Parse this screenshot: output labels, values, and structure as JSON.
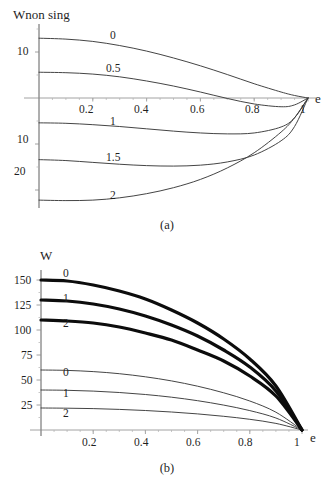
{
  "figure": {
    "panels": [
      {
        "id": "a",
        "caption": "(a)",
        "y_axis_title": "Wnon sing",
        "x_axis_title": "e",
        "y_ticks": [
          "10",
          "10",
          "20"
        ],
        "x_ticks": [
          "0.2",
          "0.4",
          "0.6",
          "0.8",
          "1"
        ],
        "curve_labels": [
          "0",
          "0.5",
          "1",
          "1.5",
          "2"
        ]
      },
      {
        "id": "b",
        "caption": "(b)",
        "y_axis_title": "W",
        "x_axis_title": "e",
        "y_ticks": [
          "150",
          "125",
          "100",
          "75",
          "50",
          "25"
        ],
        "x_ticks": [
          "0.2",
          "0.4",
          "0.6",
          "0.8",
          "1"
        ],
        "curve_labels_thick": [
          "0",
          "1",
          "2"
        ],
        "curve_labels_thin": [
          "0",
          "1",
          "2"
        ]
      }
    ]
  },
  "chart_data": [
    {
      "type": "line",
      "panel": "a",
      "title": "",
      "xlabel": "e",
      "ylabel": "Wnon sing",
      "xlim": [
        0,
        1.0
      ],
      "ylim": [
        -26,
        15
      ],
      "xticks": [
        0.2,
        0.4,
        0.6,
        0.8,
        1.0
      ],
      "yticks": [
        10,
        -10,
        -20
      ],
      "ytick_labels": [
        "10",
        "10",
        "20"
      ],
      "grid": false,
      "legend": "inline-curve-labels",
      "x": [
        0,
        0.1,
        0.2,
        0.3,
        0.4,
        0.5,
        0.6,
        0.7,
        0.8,
        0.9,
        0.95,
        1.0
      ],
      "series": [
        {
          "name": "0",
          "label": "0",
          "style": "thin",
          "values": [
            13.0,
            12.8,
            12.3,
            11.4,
            10.2,
            8.7,
            7.0,
            5.1,
            3.1,
            1.3,
            0.55,
            0.0
          ]
        },
        {
          "name": "0.5",
          "label": "0.5",
          "style": "thin",
          "values": [
            5.6,
            5.5,
            5.2,
            4.6,
            3.7,
            2.6,
            1.3,
            -0.1,
            -1.3,
            -1.9,
            -1.5,
            0.0
          ]
        },
        {
          "name": "1",
          "label": "1",
          "style": "thin",
          "values": [
            -5.4,
            -5.5,
            -5.8,
            -6.2,
            -6.7,
            -7.2,
            -7.6,
            -7.8,
            -7.6,
            -6.3,
            -4.3,
            0.0
          ]
        },
        {
          "name": "1.5",
          "label": "1.5",
          "style": "thin",
          "values": [
            -13.4,
            -13.6,
            -14.0,
            -14.4,
            -14.7,
            -14.8,
            -14.6,
            -13.9,
            -12.4,
            -9.3,
            -6.2,
            0.0
          ]
        },
        {
          "name": "2",
          "label": "2",
          "style": "thin",
          "values": [
            -22.2,
            -22.3,
            -22.2,
            -21.7,
            -20.8,
            -19.5,
            -17.7,
            -15.2,
            -11.9,
            -7.4,
            -4.3,
            0.0
          ]
        }
      ]
    },
    {
      "type": "line",
      "panel": "b",
      "title": "",
      "xlabel": "e",
      "ylabel": "W",
      "xlim": [
        0,
        1.0
      ],
      "ylim": [
        0,
        160
      ],
      "xticks": [
        0.2,
        0.4,
        0.6,
        0.8,
        1.0
      ],
      "yticks": [
        25,
        50,
        75,
        100,
        125,
        150
      ],
      "grid": false,
      "legend": "inline-curve-labels",
      "x": [
        0,
        0.1,
        0.2,
        0.3,
        0.4,
        0.5,
        0.6,
        0.7,
        0.8,
        0.9,
        1.0
      ],
      "series": [
        {
          "name": "thick-0",
          "label": "0",
          "style": "thick",
          "values": [
            150,
            149,
            145,
            139,
            131,
            120,
            107,
            91,
            71,
            44,
            0
          ]
        },
        {
          "name": "thick-1",
          "label": "1",
          "style": "thick",
          "values": [
            130,
            129,
            126,
            121,
            114,
            105,
            94,
            80,
            63,
            39,
            0
          ]
        },
        {
          "name": "thick-2",
          "label": "2",
          "style": "thick",
          "values": [
            110,
            109,
            107,
            103,
            97,
            90,
            80,
            69,
            54,
            34,
            0
          ]
        },
        {
          "name": "thin-0",
          "label": "0",
          "style": "thin",
          "values": [
            60,
            59.6,
            58.4,
            56.3,
            53.2,
            49.1,
            43.8,
            37.2,
            29.0,
            17.8,
            0
          ]
        },
        {
          "name": "thin-1",
          "label": "1",
          "style": "thin",
          "values": [
            40,
            39.7,
            38.9,
            37.5,
            35.5,
            32.8,
            29.3,
            24.9,
            19.4,
            12.0,
            0
          ]
        },
        {
          "name": "thin-2",
          "label": "2",
          "style": "thin",
          "values": [
            22,
            21.8,
            21.4,
            20.6,
            19.5,
            18.0,
            16.1,
            13.7,
            10.7,
            6.6,
            0
          ]
        }
      ]
    }
  ]
}
